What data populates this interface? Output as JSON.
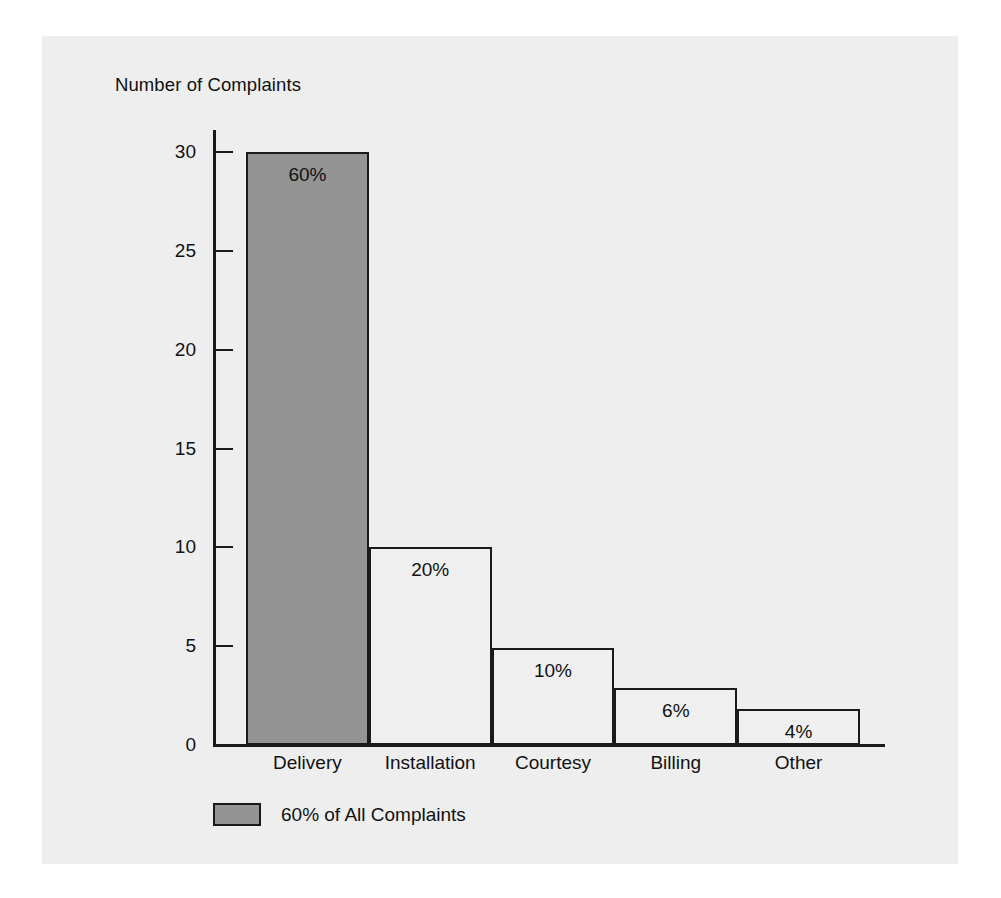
{
  "chart_data": {
    "type": "bar",
    "title": "",
    "xlabel": "",
    "ylabel": "Number of Complaints",
    "categories": [
      "Delivery",
      "Installation",
      "Courtesy",
      "Billing",
      "Other"
    ],
    "values": [
      30,
      10,
      4.9,
      2.9,
      1.8
    ],
    "data_labels": [
      "60%",
      "20%",
      "10%",
      "6%",
      "4%"
    ],
    "percentages": [
      60,
      20,
      10,
      6,
      4
    ],
    "ylim": [
      0,
      30
    ],
    "yticks": [
      0,
      5,
      10,
      15,
      20,
      25,
      30
    ],
    "ytick_labels": [
      "0",
      "5",
      "10",
      "15",
      "20",
      "25",
      "30"
    ],
    "grid": false,
    "legend": {
      "position": "bottom-left",
      "entries": [
        {
          "label": "60% of All Complaints",
          "color": "#949494"
        }
      ]
    },
    "highlight_index": 0,
    "colors": {
      "highlight_bar": "#949494",
      "plain_bar": "#efefef",
      "outline": "#1a1a1a",
      "panel_background": "#eeeeee",
      "text": "#111111"
    }
  },
  "axis": {
    "y_title": "Number of Complaints",
    "ticks": [
      {
        "value": 30,
        "label": "30"
      },
      {
        "value": 25,
        "label": "25"
      },
      {
        "value": 20,
        "label": "20"
      },
      {
        "value": 15,
        "label": "15"
      },
      {
        "value": 10,
        "label": "10"
      },
      {
        "value": 5,
        "label": "5"
      },
      {
        "value": 0,
        "label": "0"
      }
    ]
  },
  "bars": [
    {
      "category": "Delivery",
      "value": 30,
      "label": "60%",
      "filled": true
    },
    {
      "category": "Installation",
      "value": 10,
      "label": "20%",
      "filled": false
    },
    {
      "category": "Courtesy",
      "value": 4.9,
      "label": "10%",
      "filled": false
    },
    {
      "category": "Billing",
      "value": 2.9,
      "label": "6%",
      "filled": false
    },
    {
      "category": "Other",
      "value": 1.8,
      "label": "4%",
      "filled": false
    }
  ],
  "legend": {
    "swatch_color": "#949494",
    "label": "60% of All Complaints"
  }
}
